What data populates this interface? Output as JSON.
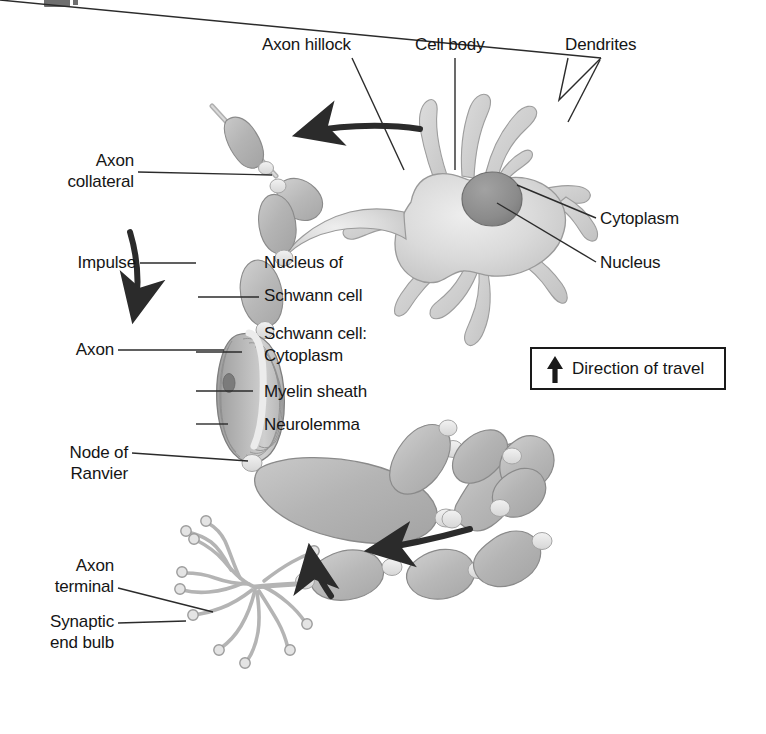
{
  "figure": {
    "background_color": "#ffffff",
    "ink_color": "#151515",
    "label_font_size_px": 17
  },
  "palette": {
    "soma_fill": "#d8d8d8",
    "soma_edge": "#9a9a9a",
    "nucleus_fill": "#8f8f8f",
    "nucleus_edge": "#6e6e6e",
    "myelin_fill": "#b9b9b9",
    "myelin_edge": "#8a8a8a",
    "node_fill": "#ebebeb",
    "dendrite_fill": "#cfcfcf",
    "terminal_fill": "#c9c9c9",
    "arrow_color": "#2b2b2b",
    "leader_color": "#2b2b2b",
    "legend_border": "#1a1a1a"
  },
  "labels": {
    "axon_hillock": "Axon hillock",
    "cell_body": "Cell body",
    "dendrites": "Dendrites",
    "axon_collateral_line1": "Axon",
    "axon_collateral_line2": "collateral",
    "impulse": "Impulse",
    "nucleus_of_schwann_line1": "Nucleus of",
    "nucleus_of_schwann_line2": "Schwann cell",
    "schwann_cell_heading": "Schwann cell:",
    "schwann_cytoplasm": "Cytoplasm",
    "myelin_sheath": "Myelin sheath",
    "neurolemma": "Neurolemma",
    "axon": "Axon",
    "node_of_ranvier_line1": "Node of",
    "node_of_ranvier_line2": "Ranvier",
    "axon_terminal_line1": "Axon",
    "axon_terminal_line2": "terminal",
    "synaptic_end_bulb_line1": "Synaptic",
    "synaptic_end_bulb_line2": "end bulb",
    "soma_cytoplasm": "Cytoplasm",
    "soma_nucleus": "Nucleus"
  },
  "legend": {
    "text": "Direction of travel",
    "arrow_icon": "up-arrow-icon",
    "arrow_direction": "up"
  },
  "annotations": {
    "impulse_arrows": [
      {
        "name": "impulse-arrow-top",
        "direction": "left",
        "description": "curved arrow along the axon hillock pointing away from the cell body"
      },
      {
        "name": "impulse-arrow-left",
        "direction": "down",
        "description": "curved arrow descending the left axon limb"
      },
      {
        "name": "impulse-arrow-bottom",
        "direction": "left",
        "description": "curved arrow along the lower axon pointing toward the terminal"
      },
      {
        "name": "impulse-arrow-terminal",
        "direction": "up",
        "description": "short curved arrow entering the axon terminal arbor"
      }
    ]
  },
  "structures": {
    "soma": "cell-body-soma",
    "nucleus": "soma-nucleus",
    "dendrite_count": 9,
    "myelin_segment_count": 11,
    "node_of_ranvier_count": 10,
    "terminal_branch_count": 11,
    "cutaway_schwann_cell": "schwann-cell-cutaway-showing-myelin-layers"
  }
}
